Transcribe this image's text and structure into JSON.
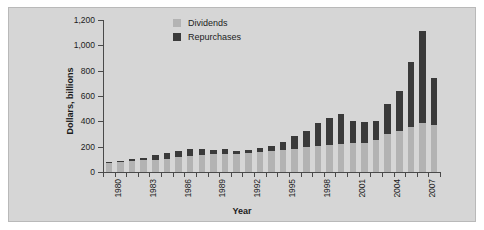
{
  "chart_data": {
    "type": "bar",
    "stacked": true,
    "title": "",
    "xlabel": "Year",
    "ylabel": "Dollars, billions",
    "ylim": [
      0,
      1200
    ],
    "yticks": [
      0,
      200,
      400,
      600,
      800,
      1000,
      1200
    ],
    "ytick_labels": [
      "0",
      "200",
      "400",
      "600",
      "800",
      "1,000",
      "1,200"
    ],
    "grid": false,
    "legend_position": "top-center",
    "x": [
      1980,
      1981,
      1982,
      1983,
      1984,
      1985,
      1986,
      1987,
      1988,
      1989,
      1990,
      1991,
      1992,
      1993,
      1994,
      1995,
      1996,
      1997,
      1998,
      1999,
      2000,
      2001,
      2002,
      2003,
      2004,
      2005,
      2006,
      2007,
      2008
    ],
    "xtick_labels": [
      "1980",
      "",
      "",
      "1983",
      "",
      "",
      "1986",
      "",
      "",
      "1989",
      "",
      "",
      "1992",
      "",
      "",
      "1995",
      "",
      "",
      "1998",
      "",
      "",
      "2001",
      "",
      "",
      "2004",
      "",
      "",
      "2007",
      ""
    ],
    "categories": [
      "1980",
      "1981",
      "1982",
      "1983",
      "1984",
      "1985",
      "1986",
      "1987",
      "1988",
      "1989",
      "1990",
      "1991",
      "1992",
      "1993",
      "1994",
      "1995",
      "1996",
      "1997",
      "1998",
      "1999",
      "2000",
      "2001",
      "2002",
      "2003",
      "2004",
      "2005",
      "2006",
      "2007",
      "2008"
    ],
    "series": [
      {
        "name": "Dividends",
        "color": "#b3b3b3",
        "values": [
          75,
          82,
          86,
          92,
          96,
          104,
          118,
          128,
          135,
          140,
          145,
          145,
          150,
          158,
          165,
          175,
          185,
          195,
          205,
          215,
          225,
          230,
          230,
          250,
          300,
          320,
          355,
          390,
          370
        ]
      },
      {
        "name": "Repurchases",
        "color": "#3a3a3a",
        "values": [
          5,
          6,
          20,
          15,
          35,
          45,
          45,
          55,
          50,
          35,
          35,
          18,
          25,
          30,
          40,
          65,
          100,
          130,
          185,
          215,
          230,
          175,
          165,
          150,
          235,
          320,
          510,
          720,
          375
        ]
      }
    ],
    "totals": [
      80,
      88,
      106,
      107,
      131,
      149,
      163,
      183,
      185,
      175,
      180,
      163,
      175,
      188,
      205,
      240,
      285,
      325,
      390,
      430,
      455,
      405,
      395,
      400,
      535,
      640,
      865,
      1110,
      745
    ]
  },
  "legend": {
    "entries": [
      {
        "label": "Dividends",
        "color": "#b3b3b3"
      },
      {
        "label": "Repurchases",
        "color": "#3a3a3a"
      }
    ]
  },
  "axes": {
    "x_title": "Year",
    "y_title": "Dollars, billions"
  },
  "colors": {
    "panel_background": "#d6d6d6",
    "figure_background": "#ffffff",
    "axis": "#4a4a4a",
    "dividends": "#b3b3b3",
    "repurchases": "#3a3a3a"
  }
}
